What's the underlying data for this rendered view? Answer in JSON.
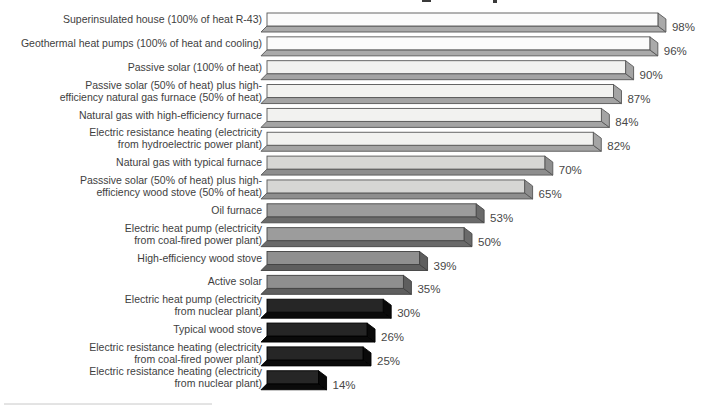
{
  "figure": {
    "background": "#ffffff",
    "bottom_rule_color": "#c8c8c8",
    "cropped_title_remnant_color": "#3a3a3a"
  },
  "chart_data": {
    "type": "bar",
    "orientation": "horizontal",
    "value_unit": "%",
    "xlim": [
      0,
      100
    ],
    "grid": false,
    "legend": false,
    "style": "3d-ribbon-bars, grayscale shading from white (highest efficiency) to black (lowest)",
    "bars": [
      {
        "label_lines": [
          "Superinsulated house (100% of heat R-43)"
        ],
        "value": 98,
        "value_label": "98%",
        "shade_group": 0
      },
      {
        "label_lines": [
          "Geothermal heat pumps (100% of heat and cooling)"
        ],
        "value": 96,
        "value_label": "96%",
        "shade_group": 0
      },
      {
        "label_lines": [
          "Passive solar (100% of heat)"
        ],
        "value": 90,
        "value_label": "90%",
        "shade_group": 1
      },
      {
        "label_lines": [
          "Passive solar (50% of heat) plus high-",
          "efficiency natural gas furnace (50% of heat)"
        ],
        "value": 87,
        "value_label": "87%",
        "shade_group": 1
      },
      {
        "label_lines": [
          "Natural gas with high-efficiency furnace"
        ],
        "value": 84,
        "value_label": "84%",
        "shade_group": 1
      },
      {
        "label_lines": [
          "Electric resistance heating (electricity",
          "from hydroelectric power plant)"
        ],
        "value": 82,
        "value_label": "82%",
        "shade_group": 1
      },
      {
        "label_lines": [
          "Natural gas with typical furnace"
        ],
        "value": 70,
        "value_label": "70%",
        "shade_group": 2
      },
      {
        "label_lines": [
          "Passsive solar (50% of heat) plus high-",
          "efficiency wood stove (50% of heat)"
        ],
        "value": 65,
        "value_label": "65%",
        "shade_group": 2
      },
      {
        "label_lines": [
          "Oil furnace"
        ],
        "value": 53,
        "value_label": "53%",
        "shade_group": 3
      },
      {
        "label_lines": [
          "Electric heat pump (electricity",
          "from coal-fired power plant)"
        ],
        "value": 50,
        "value_label": "50%",
        "shade_group": 3
      },
      {
        "label_lines": [
          "High-efficiency wood stove"
        ],
        "value": 39,
        "value_label": "39%",
        "shade_group": 4
      },
      {
        "label_lines": [
          "Active solar"
        ],
        "value": 35,
        "value_label": "35%",
        "shade_group": 4
      },
      {
        "label_lines": [
          "Electric heat pump (electricity",
          "from nuclear plant)"
        ],
        "value": 30,
        "value_label": "30%",
        "shade_group": 5
      },
      {
        "label_lines": [
          "Typical wood stove"
        ],
        "value": 26,
        "value_label": "26%",
        "shade_group": 5
      },
      {
        "label_lines": [
          "Electric resistance heating (electricity",
          "from coal-fired power plant)"
        ],
        "value": 25,
        "value_label": "25%",
        "shade_group": 5
      },
      {
        "label_lines": [
          "Electric resistance heating (electricity",
          "from nuclear plant)"
        ],
        "value": 14,
        "value_label": "14%",
        "shade_group": 5
      }
    ],
    "shade_groups": [
      {
        "face": "#fbfbfb",
        "side": "#aaaaaa",
        "stroke": "#565656"
      },
      {
        "face": "#f2f2f0",
        "side": "#a4a4a4",
        "stroke": "#565656"
      },
      {
        "face": "#d6d6d4",
        "side": "#8e8e8e",
        "stroke": "#565656"
      },
      {
        "face": "#9c9c9c",
        "side": "#6a6a6a",
        "stroke": "#474747"
      },
      {
        "face": "#8f8f8f",
        "side": "#5e5e5e",
        "stroke": "#404040"
      },
      {
        "face": "#262626",
        "side": "#0a0a0a",
        "stroke": "#000000"
      }
    ]
  }
}
